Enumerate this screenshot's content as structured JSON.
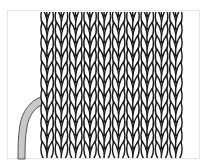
{
  "diagram": {
    "type": "knitting-stitch-diagram",
    "pattern": "stockinette",
    "columns": 10,
    "rows": 11,
    "fabric": {
      "x": 40,
      "y": 12,
      "width": 143,
      "height": 146
    },
    "colors": {
      "background": "#ffffff",
      "stroke": "#1a1a1a",
      "frame": "#e6e6e6",
      "yarn_fill": "#c8c8c8",
      "yarn_stroke": "#555555"
    },
    "yarn_tail": {
      "visible": true
    }
  }
}
